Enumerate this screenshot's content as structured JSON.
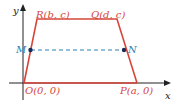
{
  "diagram": {
    "type": "coordinate-trapezoid",
    "axes": {
      "x_label": "x",
      "y_label": "y"
    },
    "points": {
      "O": "O(0, 0)",
      "P": "P(a, 0)",
      "Q": "Q(d, c)",
      "R": "R(b, c)",
      "M": "M",
      "N": "N"
    },
    "colors": {
      "trapezoid": "#d6453a",
      "midline": "#2a7fb5",
      "axes": "#222222",
      "point_dot": "#1a2a5a"
    }
  }
}
